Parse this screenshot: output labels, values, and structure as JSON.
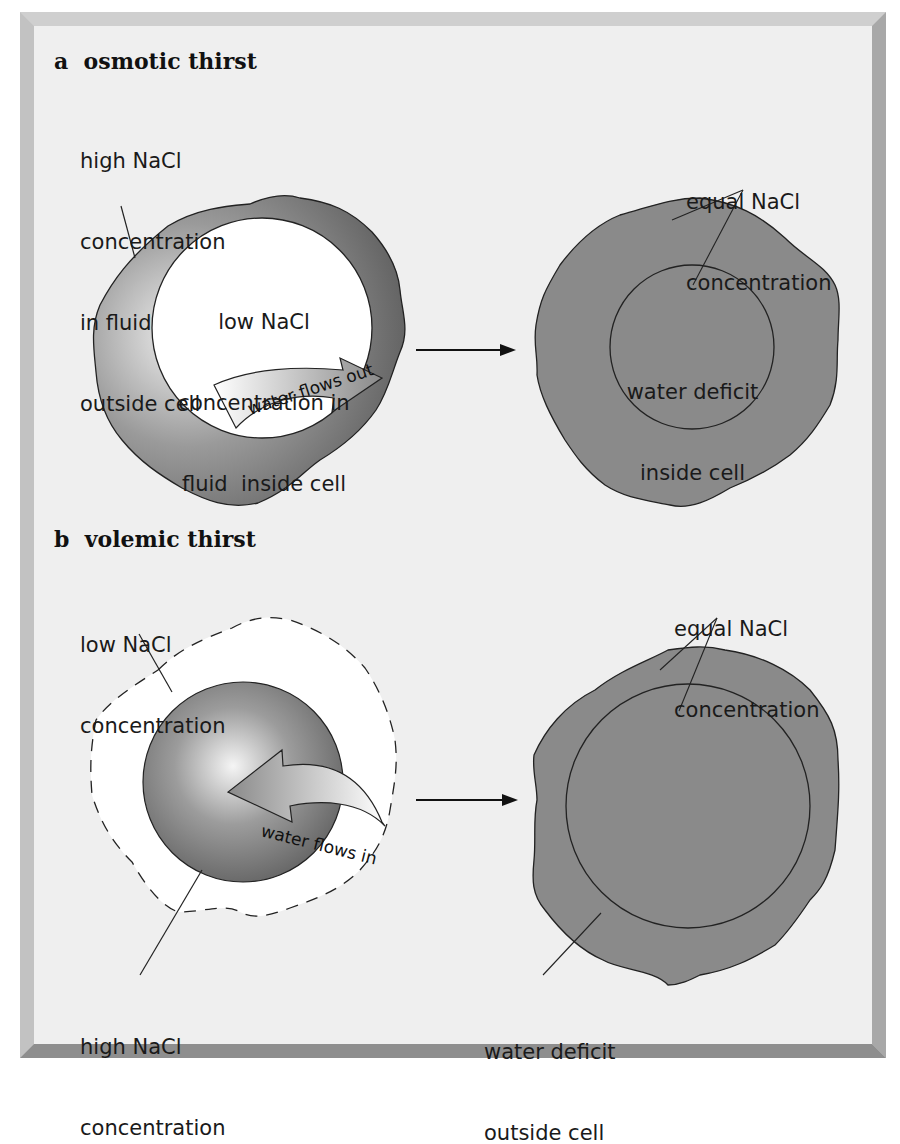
{
  "panel_a": {
    "letter": "a",
    "title": "osmotic thirst",
    "before": {
      "outside_label": [
        "high NaCl",
        "concentration",
        "in fluid",
        "outside cell"
      ],
      "inside_label": [
        "low NaCl",
        "concentration in",
        "fluid  inside cell"
      ],
      "flow_label": "water flows out"
    },
    "after": {
      "equal_label": [
        "equal NaCl",
        "concentration"
      ],
      "inside_label": [
        "water deficit",
        "inside cell"
      ]
    }
  },
  "panel_b": {
    "letter": "b",
    "title": "volemic thirst",
    "before": {
      "outside_label": [
        "low NaCl",
        "concentration"
      ],
      "inside_label": [
        "high NaCl",
        "concentration"
      ],
      "flow_label": "water flows in"
    },
    "after": {
      "equal_label": [
        "equal NaCl",
        "concentration"
      ],
      "outside_label": [
        "water deficit",
        "outside cell"
      ]
    }
  },
  "colors": {
    "background": "#efefef",
    "frame_dark": "#8c8c8c",
    "frame_light": "#c4c4c4",
    "cell_gray": "#8a8a8a",
    "outline": "#222222",
    "white": "#ffffff"
  }
}
